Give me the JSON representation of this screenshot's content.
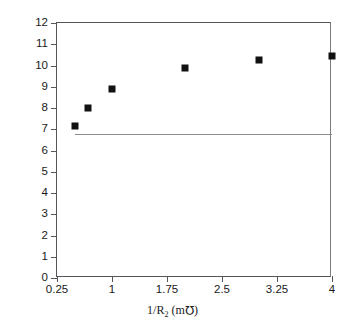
{
  "chart_data": {
    "type": "scatter",
    "title": "",
    "xlabel": "1/R2 (m℧)",
    "xlabel_parts": {
      "prefix": "1/R",
      "subscript": "2",
      "unit_open": " (m",
      "unit_symbol": "ΰ",
      "unit_close": ")"
    },
    "ylabel": "Collector Current (mA)",
    "xlim": [
      0.25,
      4
    ],
    "ylim": [
      0,
      12
    ],
    "xticks": [
      0.25,
      1,
      1.75,
      2.5,
      3.25,
      4
    ],
    "xticklabels": [
      "0.25",
      "1",
      "1.75",
      "2.5",
      "3.25",
      "4"
    ],
    "yticks": [
      0,
      1,
      2,
      3,
      4,
      5,
      6,
      7,
      8,
      9,
      10,
      11,
      12
    ],
    "yticklabels": [
      "0",
      "1",
      "2",
      "3",
      "4",
      "5",
      "6",
      "7",
      "8",
      "9",
      "10",
      "11",
      "12"
    ],
    "grid": false,
    "legend": null,
    "series": [
      {
        "name": "Collector current",
        "marker": "filled-square",
        "color": "#111111",
        "points": [
          {
            "x": 0.5,
            "y": 7.15
          },
          {
            "x": 0.67,
            "y": 8.0
          },
          {
            "x": 1.0,
            "y": 8.9
          },
          {
            "x": 2.0,
            "y": 9.9
          },
          {
            "x": 3.0,
            "y": 10.25
          },
          {
            "x": 4.0,
            "y": 10.45
          }
        ]
      }
    ],
    "reference_lines": [
      {
        "name": "horizontal-reference",
        "orientation": "horizontal",
        "y": 6.8,
        "x_start": 0.5,
        "x_end": 4,
        "color": "#8a8b8f"
      }
    ],
    "colors": {
      "axis": "#55565a",
      "marker": "#111111",
      "reference": "#8a8b8f",
      "background": "#ffffff"
    }
  }
}
